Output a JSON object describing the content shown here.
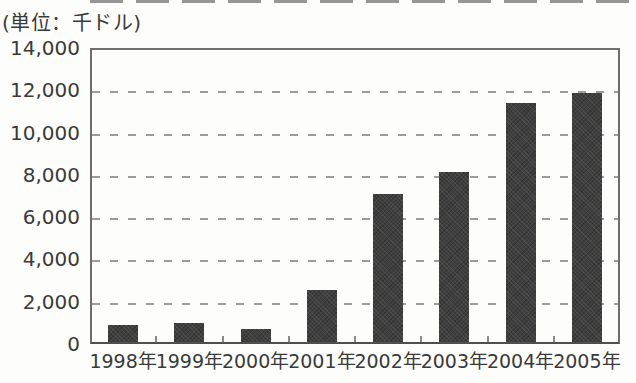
{
  "chart_data": {
    "type": "bar",
    "title": "",
    "unit_label": "(単位：千ドル)",
    "categories": [
      "1998年",
      "1999年",
      "2000年",
      "2001年",
      "2002年",
      "2003年",
      "2004年",
      "2005年"
    ],
    "values": [
      800,
      900,
      600,
      2450,
      7000,
      8050,
      11300,
      11800
    ],
    "ylim": [
      0,
      14000
    ],
    "ytick_interval": 2000,
    "ytick_labels": [
      "0",
      "2,000",
      "4,000",
      "6,000",
      "8,000",
      "10,000",
      "12,000",
      "14,000"
    ],
    "grid": "horizontal-dashed",
    "legend": "none",
    "colors": {
      "bar": "#3f3f3f",
      "gridline": "#9c9c9c",
      "axis_border": "#6e6e6e",
      "text": "#3a3a3a",
      "background": "#fdfdfc"
    }
  }
}
